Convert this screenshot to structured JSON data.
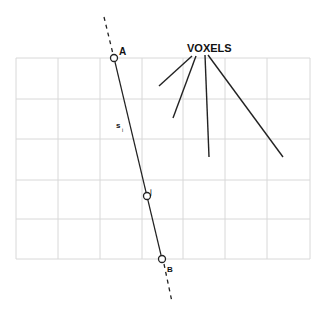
{
  "diagram": {
    "title": "VOXELS",
    "points": [
      {
        "id": "A",
        "label": "A",
        "x": 114,
        "y": 58
      },
      {
        "id": "J",
        "label": "j",
        "x": 147,
        "y": 196
      },
      {
        "id": "B",
        "label": "B",
        "x": 162,
        "y": 259
      }
    ],
    "segment_label": "s",
    "segment_label_sub": "i",
    "grid": {
      "cols": 7,
      "rows": 5,
      "left": 16,
      "top": 58,
      "right": 310,
      "bottom": 259,
      "color": "#d8d8d8"
    },
    "line_color": "#222222"
  }
}
